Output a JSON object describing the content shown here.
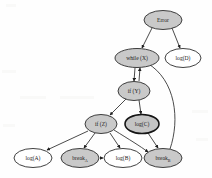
{
  "diagram": {
    "type": "directed-graph",
    "title": "",
    "background_color": "#fefefe",
    "node_fill_gray": "#c9c9c9",
    "node_fill_white": "#ffffff",
    "node_stroke": "#2b2b2b",
    "edge_stroke": "#2b2b2b",
    "nodes": [
      {
        "id": "error",
        "label": "Error",
        "sub": "",
        "style": "filled",
        "cx": 163,
        "cy": 20,
        "rx": 19,
        "ry": 9.5
      },
      {
        "id": "while_x",
        "label": "while (X)",
        "sub": "",
        "style": "filled",
        "cx": 137,
        "cy": 58,
        "rx": 22,
        "ry": 9.5
      },
      {
        "id": "log_d",
        "label": "log(D)",
        "sub": "",
        "style": "hollow",
        "cx": 183,
        "cy": 58,
        "rx": 18,
        "ry": 9.5
      },
      {
        "id": "if_y",
        "label": "if (Y)",
        "sub": "",
        "style": "filled",
        "cx": 134,
        "cy": 91,
        "rx": 16,
        "ry": 9.5
      },
      {
        "id": "if_z",
        "label": "if (Z)",
        "sub": "",
        "style": "filled",
        "cx": 101,
        "cy": 124,
        "rx": 16,
        "ry": 9.5
      },
      {
        "id": "log_c",
        "label": "log(C)",
        "sub": "",
        "style": "filled-strong",
        "cx": 142,
        "cy": 124,
        "rx": 17,
        "ry": 9.5
      },
      {
        "id": "log_a",
        "label": "log(A)",
        "sub": "",
        "style": "hollow",
        "cx": 33,
        "cy": 158,
        "rx": 19,
        "ry": 9.5
      },
      {
        "id": "break_a",
        "label": "break",
        "sub": "A",
        "style": "filled",
        "cx": 80,
        "cy": 158,
        "rx": 19,
        "ry": 9.5
      },
      {
        "id": "log_b",
        "label": "log(B)",
        "sub": "",
        "style": "hollow",
        "cx": 123,
        "cy": 158,
        "rx": 19,
        "ry": 9.5
      },
      {
        "id": "break_b",
        "label": "break",
        "sub": "B",
        "style": "filled",
        "cx": 163,
        "cy": 158,
        "rx": 19,
        "ry": 9.5
      }
    ],
    "edges": [
      {
        "id": "e1",
        "from": "error",
        "to": "while_x",
        "path": "M 152 28 L 142 48"
      },
      {
        "id": "e2",
        "from": "error",
        "to": "log_d",
        "path": "M 172 28 L 180 48"
      },
      {
        "id": "e3",
        "from": "while_x",
        "to": "if_y",
        "path": "M 135 68 L 134 81"
      },
      {
        "id": "e4",
        "from": "if_y",
        "to": "while_x",
        "path": "M 139 81 L 140 68"
      },
      {
        "id": "e5",
        "from": "if_y",
        "to": "if_z",
        "path": "M 126 99 L 110 115"
      },
      {
        "id": "e6",
        "from": "if_y",
        "to": "log_c",
        "path": "M 139 100 L 141 114"
      },
      {
        "id": "e7",
        "from": "if_z",
        "to": "log_a",
        "path": "M 88 131 L 47 150"
      },
      {
        "id": "e8",
        "from": "if_z",
        "to": "break_a",
        "path": "M 95 133 L 84 148"
      },
      {
        "id": "e9",
        "from": "if_z",
        "to": "log_b",
        "path": "M 110 133 L 120 148"
      },
      {
        "id": "e10",
        "from": "if_z",
        "to": "break_b",
        "path": "M 114 130 C 130 140 140 146 148 152"
      },
      {
        "id": "e11",
        "from": "log_c",
        "to": "break_b",
        "path": "M 148 133 L 158 148"
      },
      {
        "id": "e12",
        "from": "break_a",
        "to": "log_b",
        "path": "M 100 158 L 103 158"
      },
      {
        "id": "e13",
        "from": "break_b",
        "to": "while_x",
        "path": "M 170 149 C 180 120 176 80 147 63"
      }
    ]
  }
}
